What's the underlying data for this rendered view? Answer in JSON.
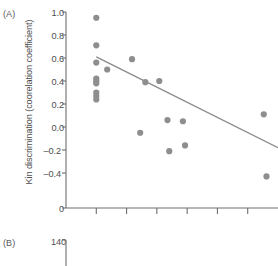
{
  "panels": {
    "a": {
      "label": "(A)"
    },
    "b": {
      "label": "(B)"
    }
  },
  "chart_data": [
    {
      "id": "panel-a",
      "type": "scatter",
      "title": "",
      "xlabel": "",
      "ylabel": "Kin discrimination (coorelation coefficient)",
      "ylim": [
        -0.5,
        1.0
      ],
      "yticks": [
        1.0,
        0.8,
        0.6,
        0.4,
        0.2,
        0.0,
        -0.2,
        -0.4
      ],
      "ytick_labels": [
        "1.0",
        "0.8",
        "0.6",
        "0.4",
        "0.2",
        "0.0",
        "–0.2",
        "–0.4"
      ],
      "axis_origin_label": "0",
      "xlim": [
        0,
        7
      ],
      "xticks": [
        1,
        2,
        3,
        4,
        5,
        6
      ],
      "xtick_labels": [
        "",
        "",
        "",
        "",
        "",
        ""
      ],
      "grid": false,
      "legend": null,
      "marker_color": "#8e8e90",
      "line_color": "#8a8a8c",
      "axis_color": "#6e6e70",
      "points": [
        {
          "x": 1.0,
          "y": 0.95
        },
        {
          "x": 1.0,
          "y": 0.71
        },
        {
          "x": 1.0,
          "y": 0.56
        },
        {
          "x": 1.0,
          "y": 0.42
        },
        {
          "x": 1.0,
          "y": 0.4
        },
        {
          "x": 1.0,
          "y": 0.38
        },
        {
          "x": 1.0,
          "y": 0.3
        },
        {
          "x": 1.0,
          "y": 0.27
        },
        {
          "x": 1.0,
          "y": 0.24
        },
        {
          "x": 1.36,
          "y": 0.5
        },
        {
          "x": 2.18,
          "y": 0.59
        },
        {
          "x": 2.62,
          "y": 0.39
        },
        {
          "x": 2.45,
          "y": -0.05
        },
        {
          "x": 3.08,
          "y": 0.4
        },
        {
          "x": 3.35,
          "y": 0.06
        },
        {
          "x": 3.41,
          "y": -0.21
        },
        {
          "x": 3.86,
          "y": 0.05
        },
        {
          "x": 3.93,
          "y": -0.16
        },
        {
          "x": 6.53,
          "y": 0.11
        },
        {
          "x": 6.62,
          "y": -0.43
        }
      ],
      "trendline": {
        "x0": 1.0,
        "y0": 0.61,
        "x1": 7.0,
        "y1": -0.18
      }
    },
    {
      "id": "panel-b",
      "type": "scatter",
      "title": "",
      "xlabel": "",
      "ylabel": "",
      "yticks": [
        140
      ],
      "ytick_labels": [
        "140"
      ],
      "grid": false,
      "axis_color": "#6e6e70",
      "points": []
    }
  ]
}
